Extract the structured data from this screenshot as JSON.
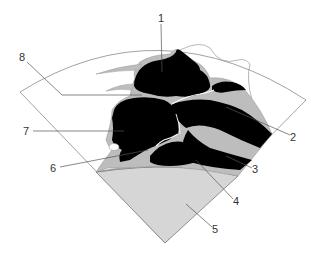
{
  "diagram": {
    "type": "echocardiographic-sector-schematic",
    "colors": {
      "background": "#ffffff",
      "chamber": "#000000",
      "tissue": "#bdbdbd",
      "near_field": "#d6d6d6",
      "outline": "#7a7a7a",
      "leader": "#555555",
      "label_text": "#333333"
    },
    "labels": [
      {
        "id": "1",
        "text": "1",
        "x": 158,
        "y": 13
      },
      {
        "id": "2",
        "text": "2",
        "x": 290,
        "y": 132
      },
      {
        "id": "3",
        "text": "3",
        "x": 252,
        "y": 164
      },
      {
        "id": "4",
        "text": "4",
        "x": 233,
        "y": 196
      },
      {
        "id": "5",
        "text": "5",
        "x": 212,
        "y": 224
      },
      {
        "id": "6",
        "text": "6",
        "x": 50,
        "y": 163
      },
      {
        "id": "7",
        "text": "7",
        "x": 23,
        "y": 126
      },
      {
        "id": "8",
        "text": "8",
        "x": 19,
        "y": 52
      }
    ]
  }
}
